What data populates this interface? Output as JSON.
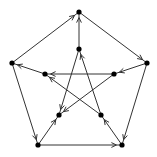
{
  "diagram": {
    "type": "directed-graph",
    "name": "Petersen graph (oriented)",
    "colors": {
      "edge": "#333333",
      "node": "#000000",
      "background": "#ffffff"
    },
    "nodes": [
      {
        "id": 0,
        "label": "outer-top",
        "x": 79,
        "y": 12
      },
      {
        "id": 1,
        "label": "outer-right",
        "x": 147,
        "y": 63
      },
      {
        "id": 2,
        "label": "outer-bottom-right",
        "x": 122,
        "y": 145
      },
      {
        "id": 3,
        "label": "outer-bottom-left",
        "x": 38,
        "y": 145
      },
      {
        "id": 4,
        "label": "outer-left",
        "x": 12,
        "y": 63
      },
      {
        "id": 5,
        "label": "inner-top",
        "x": 79,
        "y": 49
      },
      {
        "id": 6,
        "label": "inner-right",
        "x": 114,
        "y": 74
      },
      {
        "id": 7,
        "label": "inner-bottom-right",
        "x": 101,
        "y": 115
      },
      {
        "id": 8,
        "label": "inner-bottom-left",
        "x": 59,
        "y": 115
      },
      {
        "id": 9,
        "label": "inner-left",
        "x": 45,
        "y": 74
      }
    ],
    "edges": [
      {
        "from": 4,
        "to": 0
      },
      {
        "from": 5,
        "to": 0
      },
      {
        "from": 0,
        "to": 1
      },
      {
        "from": 1,
        "to": 6
      },
      {
        "from": 1,
        "to": 2
      },
      {
        "from": 3,
        "to": 2
      },
      {
        "from": 2,
        "to": 7
      },
      {
        "from": 4,
        "to": 3
      },
      {
        "from": 3,
        "to": 8
      },
      {
        "from": 9,
        "to": 4
      },
      {
        "from": 6,
        "to": 9
      },
      {
        "from": 7,
        "to": 9
      },
      {
        "from": 5,
        "to": 8
      },
      {
        "from": 6,
        "to": 8
      },
      {
        "from": 7,
        "to": 5
      }
    ]
  }
}
